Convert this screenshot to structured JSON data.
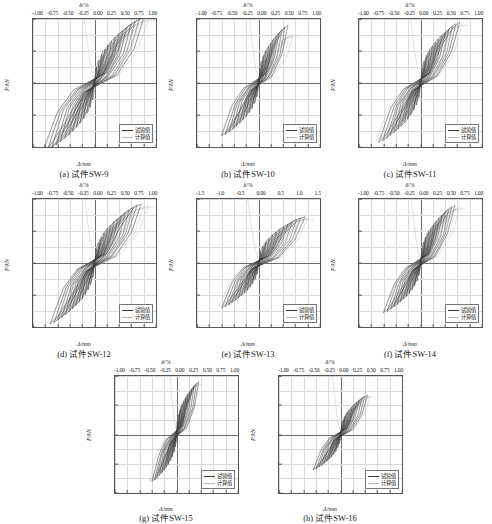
{
  "figure": {
    "axis_titles": {
      "top": "δ/%",
      "left": "P/kN",
      "bottom": "Δ/mm"
    },
    "legend": {
      "experimental": "试验值",
      "calculated": "计算值"
    },
    "colors": {
      "experimental": "#3a3a3a",
      "calculated": "#b9b9b9",
      "grid": "#d9d9d9",
      "axis": "#555555",
      "zero_axis": "#6e6e6e",
      "background": "#ffffff"
    }
  },
  "chart_data": [
    {
      "type": "line",
      "id": "sw-9",
      "caption": "(a) 试件SW-9",
      "title": "",
      "xlabel": "Δ/mm",
      "ylabel": "P/kN",
      "top_xlabel": "δ/%",
      "xlim": [
        -25,
        25
      ],
      "ylim": [
        -200,
        200
      ],
      "top_xlim": [
        -1.0,
        1.0
      ],
      "xticks": [
        -25,
        -20,
        -15,
        -10,
        -5,
        0,
        5,
        10,
        15,
        20,
        25
      ],
      "yticks": [
        -200,
        -100,
        0,
        100,
        200
      ],
      "top_xticks": [
        "-1.00",
        "-0.75",
        "-0.50",
        "-0.25",
        "0.00",
        "0.25",
        "0.50",
        "0.75",
        "1.00"
      ],
      "grid": true,
      "legend_position": "lower-right",
      "series": [
        {
          "name": "试验值",
          "peak_positive_force": 205,
          "peak_negative_force": -215,
          "peak_positive_disp": 20,
          "peak_negative_disp": -21,
          "cycles": 14
        },
        {
          "name": "计算值",
          "peak_positive_force": 200,
          "peak_negative_force": -210,
          "peak_positive_disp": 22,
          "peak_negative_disp": -21,
          "cycles": 14
        }
      ]
    },
    {
      "type": "line",
      "id": "sw-10",
      "caption": "(b) 试件SW-10",
      "title": "",
      "xlabel": "Δ/mm",
      "ylabel": "P/kN",
      "top_xlabel": "δ/%",
      "xlim": [
        -25,
        25
      ],
      "ylim": [
        -200,
        200
      ],
      "top_xlim": [
        -1.0,
        1.0
      ],
      "xticks": [
        -25,
        -20,
        -15,
        -10,
        -5,
        0,
        5,
        10,
        15,
        20,
        25
      ],
      "yticks": [
        -200,
        -100,
        0,
        100,
        200
      ],
      "top_xticks": [
        "-1.00",
        "-0.75",
        "-0.50",
        "-0.25",
        "0.00",
        "0.25",
        "0.50",
        "0.75",
        "1.00"
      ],
      "grid": true,
      "legend_position": "lower-right",
      "series": [
        {
          "name": "试验值",
          "peak_positive_force": 180,
          "peak_negative_force": -165,
          "peak_positive_disp": 12,
          "peak_negative_disp": -15,
          "cycles": 12
        },
        {
          "name": "计算值",
          "peak_positive_force": 150,
          "peak_negative_force": -160,
          "peak_positive_disp": 14,
          "peak_negative_disp": -15,
          "cycles": 12
        }
      ]
    },
    {
      "type": "line",
      "id": "sw-11",
      "caption": "(c) 试件SW-11",
      "title": "",
      "xlabel": "Δ/mm",
      "ylabel": "P/kN",
      "top_xlabel": "δ/%",
      "xlim": [
        -25,
        25
      ],
      "ylim": [
        -200,
        200
      ],
      "top_xlim": [
        -1.0,
        1.0
      ],
      "xticks": [
        -25,
        -20,
        -15,
        -10,
        -5,
        0,
        5,
        10,
        15,
        20,
        25
      ],
      "yticks": [
        -200,
        -100,
        0,
        100,
        200
      ],
      "top_xticks": [
        "-1.00",
        "-0.75",
        "-0.50",
        "-0.25",
        "0.00",
        "0.25",
        "0.50",
        "0.75",
        "1.00"
      ],
      "grid": true,
      "legend_position": "lower-right",
      "series": [
        {
          "name": "试验值",
          "peak_positive_force": 190,
          "peak_negative_force": -185,
          "peak_positive_disp": 16,
          "peak_negative_disp": -17,
          "cycles": 13
        },
        {
          "name": "计算值",
          "peak_positive_force": 185,
          "peak_negative_force": -180,
          "peak_positive_disp": 17,
          "peak_negative_disp": -18,
          "cycles": 13
        }
      ]
    },
    {
      "type": "line",
      "id": "sw-12",
      "caption": "(d) 试件SW-12",
      "title": "",
      "xlabel": "Δ/mm",
      "ylabel": "P/kN",
      "top_xlabel": "δ/%",
      "xlim": [
        -25,
        25
      ],
      "ylim": [
        -200,
        200
      ],
      "top_xlim": [
        -1.0,
        1.0
      ],
      "xticks": [
        -25,
        -20,
        -15,
        -10,
        -5,
        0,
        5,
        10,
        15,
        20,
        25
      ],
      "yticks": [
        -200,
        -100,
        0,
        100,
        200
      ],
      "top_xticks": [
        "-1.00",
        "-0.75",
        "-0.50",
        "-0.25",
        "0.00",
        "0.25",
        "0.50",
        "0.75",
        "1.00"
      ],
      "grid": true,
      "legend_position": "lower-right",
      "series": [
        {
          "name": "试验值",
          "peak_positive_force": 185,
          "peak_negative_force": -190,
          "peak_positive_disp": 19,
          "peak_negative_disp": -18,
          "cycles": 14
        },
        {
          "name": "计算值",
          "peak_positive_force": 180,
          "peak_negative_force": -185,
          "peak_positive_disp": 22,
          "peak_negative_disp": -18,
          "cycles": 14
        }
      ]
    },
    {
      "type": "line",
      "id": "sw-13",
      "caption": "(e) 试件SW-13",
      "title": "",
      "xlabel": "Δ/mm",
      "ylabel": "P/kN",
      "top_xlabel": "δ/%",
      "xlim": [
        -25,
        25
      ],
      "ylim": [
        -200,
        200
      ],
      "top_xlim": [
        -1.5,
        1.5
      ],
      "xticks": [
        -25,
        -20,
        -15,
        -10,
        -5,
        0,
        5,
        10,
        15,
        20,
        25
      ],
      "yticks": [
        -200,
        -100,
        0,
        100,
        200
      ],
      "top_xticks": [
        "-1.5",
        "-1.0",
        "-0.5",
        "0.00",
        "0.5",
        "1.0",
        "1.5"
      ],
      "grid": true,
      "legend_position": "lower-right",
      "series": [
        {
          "name": "试验值",
          "peak_positive_force": 145,
          "peak_negative_force": -140,
          "peak_positive_disp": 19,
          "peak_negative_disp": -15,
          "cycles": 13
        },
        {
          "name": "计算值",
          "peak_positive_force": 140,
          "peak_negative_force": -135,
          "peak_positive_disp": 20,
          "peak_negative_disp": -16,
          "cycles": 13
        }
      ]
    },
    {
      "type": "line",
      "id": "sw-14",
      "caption": "(f) 试件SW-14",
      "title": "",
      "xlabel": "Δ/mm",
      "ylabel": "P/kN",
      "top_xlabel": "δ/%",
      "xlim": [
        -25,
        25
      ],
      "ylim": [
        -200,
        200
      ],
      "top_xlim": [
        -1.0,
        1.0
      ],
      "xticks": [
        -25,
        -20,
        -15,
        -10,
        -5,
        0,
        5,
        10,
        15,
        20,
        25
      ],
      "yticks": [
        -200,
        -100,
        0,
        100,
        200
      ],
      "top_xticks": [
        "-1.00",
        "-0.75",
        "-0.50",
        "-0.25",
        "0.00",
        "0.25",
        "0.50",
        "0.75",
        "1.00"
      ],
      "grid": true,
      "legend_position": "lower-right",
      "series": [
        {
          "name": "试验值",
          "peak_positive_force": 180,
          "peak_negative_force": -155,
          "peak_positive_disp": 14,
          "peak_negative_disp": -15,
          "cycles": 13
        },
        {
          "name": "计算值",
          "peak_positive_force": 175,
          "peak_negative_force": -150,
          "peak_positive_disp": 16,
          "peak_negative_disp": -15,
          "cycles": 13
        }
      ]
    },
    {
      "type": "line",
      "id": "sw-15",
      "caption": "(g) 试件SW-15",
      "title": "",
      "xlabel": "Δ/mm",
      "ylabel": "P/kN",
      "top_xlabel": "δ/%",
      "xlim": [
        -25,
        25
      ],
      "ylim": [
        -200,
        200
      ],
      "top_xlim": [
        -1.0,
        1.0
      ],
      "xticks": [
        -25,
        -20,
        -15,
        -10,
        -5,
        0,
        5,
        10,
        15,
        20,
        25
      ],
      "yticks": [
        -200,
        -100,
        0,
        100,
        200
      ],
      "top_xticks": [
        "-1.00",
        "-0.75",
        "-0.50",
        "-0.25",
        "0.00",
        "0.25",
        "0.50",
        "0.75",
        "1.00"
      ],
      "grid": true,
      "legend_position": "lower-right",
      "series": [
        {
          "name": "试验值",
          "peak_positive_force": 180,
          "peak_negative_force": -160,
          "peak_positive_disp": 9,
          "peak_negative_disp": -10,
          "cycles": 12
        },
        {
          "name": "计算值",
          "peak_positive_force": 175,
          "peak_negative_force": -158,
          "peak_positive_disp": 9,
          "peak_negative_disp": -11,
          "cycles": 12
        }
      ]
    },
    {
      "type": "line",
      "id": "sw-16",
      "caption": "(h) 试件SW-16",
      "title": "",
      "xlabel": "Δ/mm",
      "ylabel": "P/kN",
      "top_xlabel": "δ/%",
      "xlim": [
        -25,
        25
      ],
      "ylim": [
        -200,
        200
      ],
      "top_xlim": [
        -1.0,
        1.0
      ],
      "xticks": [
        -25,
        -20,
        -15,
        -10,
        -5,
        0,
        5,
        10,
        15,
        20,
        25
      ],
      "yticks": [
        -200,
        -100,
        0,
        100,
        200
      ],
      "top_xticks": [
        "-1.00",
        "-0.75",
        "-0.50",
        "-0.25",
        "0.00",
        "0.25",
        "0.50",
        "0.75",
        "1.00"
      ],
      "grid": true,
      "legend_position": "lower-right",
      "series": [
        {
          "name": "试验值",
          "peak_positive_force": 135,
          "peak_negative_force": -120,
          "peak_positive_disp": 11,
          "peak_negative_disp": -11,
          "cycles": 12
        },
        {
          "name": "计算值",
          "peak_positive_force": 132,
          "peak_negative_force": -118,
          "peak_positive_disp": 12,
          "peak_negative_disp": -11,
          "cycles": 12
        }
      ]
    }
  ]
}
